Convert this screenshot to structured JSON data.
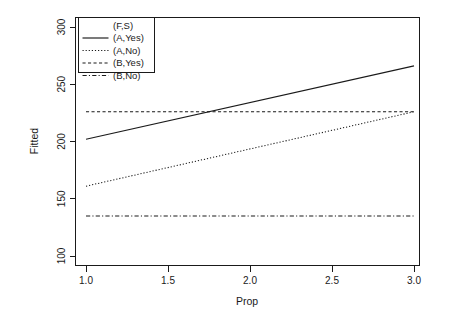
{
  "chart_data": {
    "type": "line",
    "title": "",
    "xlabel": "Prop",
    "ylabel": "Fitted",
    "xlim": [
      1.0,
      3.0
    ],
    "ylim": [
      100,
      300
    ],
    "xticks": [
      "1.0",
      "1.5",
      "2.0",
      "2.5",
      "3.0"
    ],
    "xtick_values": [
      1.0,
      1.5,
      2.0,
      2.5,
      3.0
    ],
    "yticks": [
      "100",
      "150",
      "200",
      "250",
      "300"
    ],
    "ytick_values": [
      100,
      150,
      200,
      250,
      300
    ],
    "grid": false,
    "legend_position": "top-left-inside",
    "legend_title": "(F,S)",
    "x": [
      1.0,
      3.0
    ],
    "series": [
      {
        "name": "(A,Yes)",
        "linestyle": "solid",
        "color": "#1a1a1a",
        "values": [
          202,
          266
        ]
      },
      {
        "name": "(A,No)",
        "linestyle": "dotted",
        "color": "#1a1a1a",
        "values": [
          161,
          226
        ]
      },
      {
        "name": "(B,Yes)",
        "linestyle": "dashed",
        "color": "#1a1a1a",
        "values": [
          226,
          226
        ]
      },
      {
        "name": "(B,No)",
        "linestyle": "dotdash",
        "color": "#1a1a1a",
        "values": [
          135,
          135
        ]
      }
    ]
  },
  "axes": {
    "x_title": "Prop",
    "y_title": "Fitted",
    "x_tick_labels": [
      "1.0",
      "1.5",
      "2.0",
      "2.5",
      "3.0"
    ],
    "y_tick_labels": [
      "100",
      "150",
      "200",
      "250",
      "300"
    ]
  },
  "legend": {
    "title": "(F,S)",
    "entries": [
      {
        "label": "(A,Yes)",
        "linestyle": "solid"
      },
      {
        "label": "(A,No)",
        "linestyle": "dotted"
      },
      {
        "label": "(B,Yes)",
        "linestyle": "dashed"
      },
      {
        "label": "(B,No)",
        "linestyle": "dotdash"
      }
    ]
  },
  "colors": {
    "foreground": "#1a1a1a",
    "background": "#ffffff"
  }
}
